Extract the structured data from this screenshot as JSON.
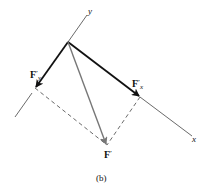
{
  "figure": {
    "caption": "(b)",
    "axes": {
      "x_label": "x",
      "y_label": "y"
    },
    "vectors": [
      {
        "id": "F_prime_y",
        "label_main": "F",
        "label_sup": "′",
        "label_sub": "y",
        "color": "#111111",
        "style": "bold-arrow"
      },
      {
        "id": "F_prime_x",
        "label_main": "F",
        "label_sup": "′",
        "label_sub": "x",
        "color": "#111111",
        "style": "bold-arrow"
      },
      {
        "id": "F_prime",
        "label_main": "F",
        "label_sup": "′",
        "label_sub": "",
        "color": "#777777",
        "style": "gray-arrow"
      }
    ],
    "construction_lines": "dashed parallelogram completing components F′x and F′y to resultant F′"
  }
}
